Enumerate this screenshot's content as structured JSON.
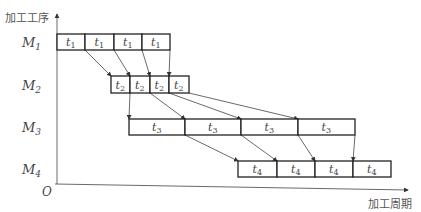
{
  "diagram": {
    "y_axis_label": "加工工序",
    "x_axis_label": "加工周期",
    "origin_label": "O",
    "machines": [
      {
        "name": "M",
        "sub": "1",
        "y": 34,
        "h": 16,
        "task": "t",
        "task_sub": "1",
        "boxes": [
          [
            57,
            85
          ],
          [
            85,
            114
          ],
          [
            114,
            142
          ],
          [
            142,
            170
          ]
        ]
      },
      {
        "name": "M",
        "sub": "2",
        "y": 76,
        "h": 17,
        "task": "t",
        "task_sub": "2",
        "boxes": [
          [
            111,
            130
          ],
          [
            130,
            150
          ],
          [
            150,
            169
          ],
          [
            169,
            189
          ]
        ]
      },
      {
        "name": "M",
        "sub": "3",
        "y": 119,
        "h": 16,
        "task": "t",
        "task_sub": "3",
        "boxes": [
          [
            129,
            185
          ],
          [
            185,
            241
          ],
          [
            241,
            298
          ],
          [
            298,
            355
          ]
        ]
      },
      {
        "name": "M",
        "sub": "4",
        "y": 161,
        "h": 16,
        "task": "t",
        "task_sub": "4",
        "boxes": [
          [
            238,
            277
          ],
          [
            277,
            315
          ],
          [
            315,
            353
          ],
          [
            353,
            391
          ]
        ]
      }
    ]
  }
}
